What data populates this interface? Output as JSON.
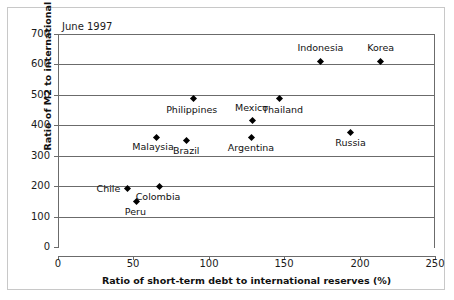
{
  "chart_data": {
    "type": "scatter",
    "title": "June 1997",
    "xlabel": "Ratio of short-term debt to international reserves (%)",
    "ylabel": "Ratio of M2 to international reserves (%)",
    "xlim": [
      0,
      250
    ],
    "ylim": [
      0,
      700
    ],
    "xticks": [
      "0",
      "50",
      "100",
      "150",
      "200",
      "250"
    ],
    "yticks": [
      "0",
      "100",
      "200",
      "300",
      "400",
      "500",
      "600",
      "700"
    ],
    "grid": "horizontal",
    "legend": "none",
    "marker_color": "#000000",
    "marker_shape": "diamond",
    "points": [
      {
        "label": "Indonesia",
        "x": 174,
        "y": 610
      },
      {
        "label": "Korea",
        "x": 214,
        "y": 610
      },
      {
        "label": "Philippines",
        "x": 90,
        "y": 488
      },
      {
        "label": "Thailand",
        "x": 147,
        "y": 488
      },
      {
        "label": "Mexico",
        "x": 129,
        "y": 416
      },
      {
        "label": "Malaysia",
        "x": 65,
        "y": 360
      },
      {
        "label": "Brazil",
        "x": 85,
        "y": 351
      },
      {
        "label": "Argentina",
        "x": 128,
        "y": 361
      },
      {
        "label": "Russia",
        "x": 194,
        "y": 377
      },
      {
        "label": "Chile",
        "x": 46,
        "y": 193
      },
      {
        "label": "Colombia",
        "x": 67,
        "y": 200
      },
      {
        "label": "Peru",
        "x": 52,
        "y": 151
      }
    ]
  }
}
